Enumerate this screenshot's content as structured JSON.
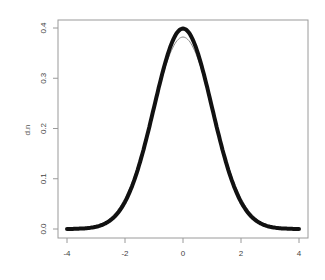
{
  "chart_data": {
    "type": "line",
    "title": "",
    "xlabel": "",
    "ylabel": "d.n",
    "xlim": [
      -4,
      4
    ],
    "ylim": [
      0,
      0.4
    ],
    "grid": false,
    "legend": null,
    "x_ticks": [
      -4,
      -2,
      0,
      2,
      4
    ],
    "x_tick_labels": [
      "-4",
      "-2",
      "0",
      "2",
      "4"
    ],
    "y_ticks": [
      0.0,
      0.1,
      0.2,
      0.3,
      0.4
    ],
    "y_tick_labels": [
      "0.0",
      "0.1",
      "0.2",
      "0.3",
      "0.4"
    ],
    "series": [
      {
        "name": "normal density (points)",
        "style": "thick-points",
        "color": "#111111",
        "x": [
          -4,
          -3.5,
          -3,
          -2.5,
          -2,
          -1.5,
          -1,
          -0.5,
          0,
          0.5,
          1,
          1.5,
          2,
          2.5,
          3,
          3.5,
          4
        ],
        "values": [
          0.0001,
          0.0009,
          0.0044,
          0.0175,
          0.054,
          0.1295,
          0.242,
          0.3521,
          0.3989,
          0.3521,
          0.242,
          0.1295,
          0.054,
          0.0175,
          0.0044,
          0.0009,
          0.0001
        ]
      },
      {
        "name": "kernel density estimate",
        "style": "thin-line",
        "color": "#8a8a8a",
        "x": [
          -4,
          -3.5,
          -3,
          -2.5,
          -2,
          -1.5,
          -1,
          -0.5,
          0,
          0.5,
          1,
          1.5,
          2,
          2.5,
          3,
          3.5,
          4
        ],
        "values": [
          0.0003,
          0.0018,
          0.0075,
          0.0235,
          0.061,
          0.133,
          0.237,
          0.338,
          0.382,
          0.338,
          0.237,
          0.133,
          0.061,
          0.0235,
          0.0075,
          0.0018,
          0.0003
        ]
      }
    ]
  },
  "colors": {
    "background": "#ffffff",
    "frame": "#9a9a9a",
    "points": "#111111",
    "kde_line": "#8a8a8a"
  }
}
